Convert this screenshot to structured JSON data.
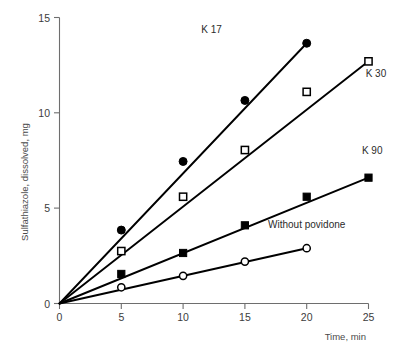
{
  "chart_data": {
    "type": "line",
    "title": "",
    "subtitle": "",
    "xlabel": "Time, min",
    "ylabel": "Sulfathiazole, dissolved, mg",
    "xlim": [
      0,
      25
    ],
    "ylim": [
      0,
      15
    ],
    "xticks": [
      0,
      5,
      10,
      15,
      20,
      25
    ],
    "yticks": [
      0,
      5,
      10,
      15
    ],
    "xtick_labels": [
      "0",
      "5",
      "10",
      "15",
      "20",
      "25"
    ],
    "ytick_labels": [
      "0",
      "5",
      "10",
      "15"
    ],
    "grid": false,
    "legend_position": "inline-annotations",
    "series": [
      {
        "name": "K 17",
        "marker": "filled-circle",
        "color": "#000000",
        "label_text": "K 17",
        "x": [
          0,
          5,
          10,
          15,
          20
        ],
        "values": [
          0,
          3.85,
          7.45,
          10.65,
          13.65
        ]
      },
      {
        "name": "K 30",
        "marker": "open-square",
        "color": "#000000",
        "label_text": "K 30",
        "x": [
          0,
          5,
          10,
          15,
          20,
          25
        ],
        "values": [
          0,
          2.75,
          5.6,
          8.05,
          11.1,
          12.7
        ]
      },
      {
        "name": "K 90",
        "marker": "filled-square",
        "color": "#000000",
        "label_text": "K 90",
        "x": [
          0,
          5,
          10,
          15,
          20,
          25
        ],
        "values": [
          0,
          1.55,
          2.65,
          4.1,
          5.6,
          6.6
        ]
      },
      {
        "name": "Without povidone",
        "marker": "open-circle",
        "color": "#000000",
        "label_text": "Without povidone",
        "x": [
          0,
          5,
          10,
          15,
          20
        ],
        "values": [
          0,
          0.85,
          1.45,
          2.2,
          2.9
        ]
      }
    ],
    "annotations": [
      {
        "text": "K 17",
        "x": 12.3,
        "y": 14.2
      },
      {
        "text": "K 30",
        "x": 25.6,
        "y": 11.9
      },
      {
        "text": "K 90",
        "x": 25.3,
        "y": 7.85
      },
      {
        "text": "Without povidone",
        "x": 20.0,
        "y": 3.95
      }
    ]
  }
}
